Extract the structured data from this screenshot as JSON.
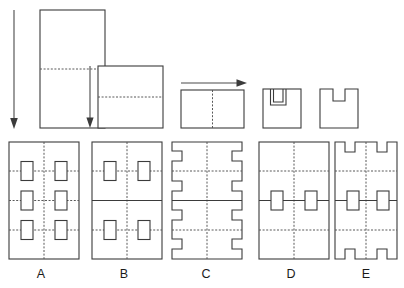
{
  "diagram": {
    "background_color": "#ffffff",
    "line_color": "#3b3b3b",
    "dash_color": "#585858"
  },
  "sequence": {
    "name": "folding-sequence",
    "steps": [
      {
        "id": "step-1",
        "label": "unfolded-sheet",
        "shape": "tall-rectangle",
        "fold_line": "horizontal-dashed-center",
        "arrow": "down",
        "x": 40,
        "y": 10,
        "w": 65,
        "h": 118
      },
      {
        "id": "step-2",
        "label": "folded-once",
        "shape": "square",
        "fold_line": "horizontal-dashed",
        "arrow": "down",
        "x": 98,
        "y": 66,
        "w": 65,
        "h": 62
      },
      {
        "id": "step-3",
        "label": "folded-twice",
        "shape": "wide-rectangle",
        "fold_line": "vertical-dashed-center",
        "arrow": "right",
        "x": 181,
        "y": 90,
        "w": 63,
        "h": 38
      },
      {
        "id": "step-4",
        "label": "notch-cut",
        "shape": "square-with-cut",
        "fold_line": "none",
        "arrow": "none",
        "x": 263,
        "y": 89,
        "w": 38,
        "h": 39
      },
      {
        "id": "step-5",
        "label": "notch-removed",
        "shape": "square-with-notch",
        "fold_line": "none",
        "arrow": "none",
        "x": 320,
        "y": 89,
        "w": 38,
        "h": 39
      }
    ]
  },
  "choices": {
    "name": "answer-options",
    "items": [
      {
        "label": "A",
        "pattern": "six-inner-rectangles",
        "rows": 3,
        "cols": 2,
        "holes": 6,
        "edge_notches": 0,
        "x": 9,
        "y": 142,
        "w": 70,
        "h": 117
      },
      {
        "label": "B",
        "pattern": "four-inner-rectangles",
        "rows": 2,
        "cols": 2,
        "holes": 4,
        "edge_notches": 0,
        "x": 92,
        "y": 142,
        "w": 70,
        "h": 117
      },
      {
        "label": "C",
        "pattern": "edge-notches-left-right",
        "rows": 0,
        "cols": 0,
        "holes": 0,
        "edge_notches": 12,
        "x": 172,
        "y": 142,
        "w": 70,
        "h": 117
      },
      {
        "label": "D",
        "pattern": "two-center-rectangles",
        "rows": 1,
        "cols": 2,
        "holes": 2,
        "edge_notches": 0,
        "x": 259,
        "y": 142,
        "w": 70,
        "h": 117
      },
      {
        "label": "E",
        "pattern": "top-bottom-notches-with-two-rectangles",
        "rows": 1,
        "cols": 2,
        "holes": 2,
        "edge_notches": 4,
        "x": 335,
        "y": 142,
        "w": 62,
        "h": 117
      }
    ]
  }
}
